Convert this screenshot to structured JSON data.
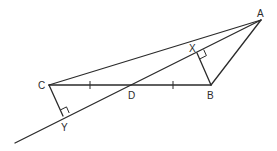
{
  "diagram": {
    "type": "geometry",
    "points": {
      "A": {
        "label": "A",
        "x": 261,
        "y": 20
      },
      "B": {
        "label": "B",
        "x": 211,
        "y": 85
      },
      "C": {
        "label": "C",
        "x": 49,
        "y": 85
      },
      "D": {
        "label": "D",
        "x": 130,
        "y": 85
      },
      "X": {
        "label": "X",
        "x": 197,
        "y": 53
      },
      "Y": {
        "label": "Y",
        "x": 63,
        "y": 116
      }
    },
    "segments": [
      "AC",
      "AB",
      "CB",
      "AY (line through A, X, D, Y extended)",
      "BX",
      "CY"
    ],
    "equal_marks": [
      "CD",
      "DB"
    ],
    "right_angles": [
      "X (BX ⟂ AY)",
      "Y (CY ⟂ AY)"
    ],
    "colors": {
      "stroke": "#2b2b2b",
      "background": "#ffffff"
    }
  }
}
